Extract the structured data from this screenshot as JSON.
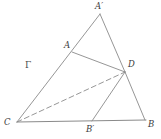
{
  "figure": {
    "name": "triangle-construction-diagram",
    "width": 161,
    "height": 139,
    "background_color": "#ffffff",
    "stroke_color": "#8a8a8a",
    "label_color": "#3c3c3c",
    "stroke_width": 0.9
  },
  "points": {
    "A_prime": {
      "label": "A′",
      "x": 100,
      "y": 14,
      "label_x": 95,
      "label_y": 2
    },
    "A": {
      "label": "A",
      "x": 72,
      "y": 52,
      "label_x": 64,
      "label_y": 41
    },
    "D": {
      "label": "D",
      "x": 125,
      "y": 72,
      "label_x": 128,
      "label_y": 60
    },
    "C": {
      "label": "C",
      "x": 17,
      "y": 122,
      "label_x": 4,
      "label_y": 118
    },
    "B_prime": {
      "label": "B′",
      "x": 92,
      "y": 121,
      "label_x": 86,
      "label_y": 125
    },
    "B": {
      "label": "B",
      "x": 145,
      "y": 120,
      "label_x": 148,
      "label_y": 120
    }
  },
  "region": {
    "gamma": {
      "label": "Γ",
      "label_x": 25,
      "label_y": 61
    }
  },
  "segments": [
    {
      "name": "segment-C-A-Aprime",
      "from": "C",
      "to": "A_prime",
      "style": "solid"
    },
    {
      "name": "segment-Aprime-D",
      "from": "A_prime",
      "to": "D",
      "style": "solid"
    },
    {
      "name": "segment-D-B",
      "from": "D",
      "to": "B",
      "style": "solid"
    },
    {
      "name": "segment-C-B",
      "from": "C",
      "to": "B",
      "style": "solid"
    },
    {
      "name": "segment-A-D",
      "from": "A",
      "to": "D",
      "style": "solid"
    },
    {
      "name": "segment-D-Bprime",
      "from": "D",
      "to": "B_prime",
      "style": "solid"
    },
    {
      "name": "segment-C-D",
      "from": "C",
      "to": "D",
      "style": "dashed"
    }
  ]
}
